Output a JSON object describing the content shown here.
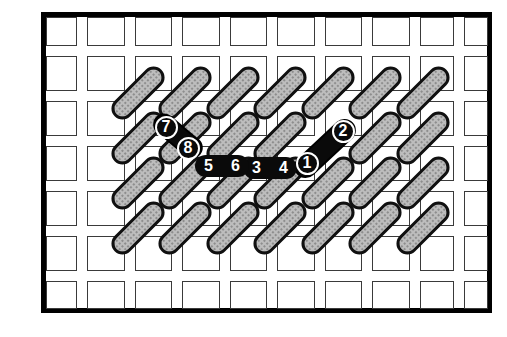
{
  "figure": {
    "type": "needlepoint-stitch-diagram",
    "description_numbers_shown": [
      "1",
      "2",
      "3",
      "4",
      "5",
      "6",
      "7",
      "8"
    ],
    "colors": {
      "background": "#ffffff",
      "frame_border": "#000000",
      "mesh_line": "#3a3a3a",
      "stitch_fill": "#bdbdbd",
      "stitch_stipple": "#8d8d8d",
      "stitch_outline": "#101010",
      "black_stitch": "#0a0a0a",
      "number_text": "#ffffff"
    }
  },
  "canvas_grid": {
    "frame": {
      "x": 41,
      "y": 12,
      "width": 451,
      "height": 301,
      "border_px": 5
    },
    "col_edges": [
      [
        46,
        31
      ],
      [
        87,
        37.5
      ],
      [
        134.5,
        37.5
      ],
      [
        182,
        37.5
      ],
      [
        229.5,
        37.5
      ],
      [
        277,
        37.5
      ],
      [
        324.5,
        37.5
      ],
      [
        372,
        37.5
      ],
      [
        419.5,
        34.5
      ],
      [
        464,
        24
      ]
    ],
    "row_edges": [
      [
        17,
        29
      ],
      [
        56,
        35
      ],
      [
        101,
        35
      ],
      [
        146,
        35
      ],
      [
        191,
        35
      ],
      [
        236,
        34.5
      ],
      [
        280.5,
        28.5
      ]
    ]
  },
  "stitches": {
    "gray_length": 66,
    "gray_width": 22,
    "gray_angle_deg": -45,
    "gray_centers": [
      [
        137.5,
        93
      ],
      [
        185,
        93
      ],
      [
        232.5,
        93
      ],
      [
        280,
        93
      ],
      [
        327.5,
        93
      ],
      [
        375,
        93
      ],
      [
        422.5,
        93
      ],
      [
        137.5,
        138
      ],
      [
        185,
        138
      ],
      [
        232.5,
        138
      ],
      [
        280,
        138
      ],
      [
        375,
        138
      ],
      [
        422.5,
        138
      ],
      [
        137.5,
        183
      ],
      [
        185,
        183
      ],
      [
        232.5,
        183
      ],
      [
        280,
        183
      ],
      [
        327.5,
        183
      ],
      [
        375,
        183
      ],
      [
        422.5,
        183
      ],
      [
        137.5,
        228
      ],
      [
        185,
        228
      ],
      [
        232.5,
        228
      ],
      [
        280,
        228
      ],
      [
        327.5,
        228
      ],
      [
        375,
        228
      ],
      [
        422.5,
        228
      ]
    ],
    "black": [
      {
        "name": "stitch-1-2",
        "cx": 324.5,
        "cy": 148,
        "len": 76,
        "wid": 23,
        "angle": -43
      },
      {
        "name": "stitch-7-8",
        "cx": 177.5,
        "cy": 136,
        "len": 58,
        "wid": 22,
        "angle": 40
      }
    ]
  },
  "bars": [
    {
      "x": 243,
      "y": 157,
      "w": 54,
      "h": 22,
      "labels": [
        "3",
        "4"
      ]
    },
    {
      "x": 195,
      "y": 155,
      "w": 54,
      "h": 22,
      "labels": [
        "5",
        "6"
      ]
    }
  ],
  "markers": [
    {
      "label": "1",
      "cx": 307,
      "cy": 163,
      "d": 23
    },
    {
      "label": "2",
      "cx": 343,
      "cy": 131,
      "d": 23
    },
    {
      "label": "7",
      "cx": 166,
      "cy": 127,
      "d": 23
    },
    {
      "label": "8",
      "cx": 188,
      "cy": 148,
      "d": 23
    }
  ]
}
